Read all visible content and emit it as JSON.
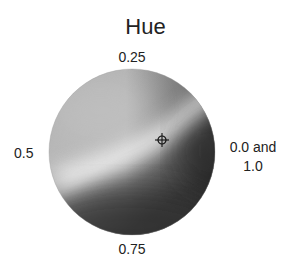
{
  "diagram": {
    "title": "Hue",
    "labels": {
      "top": "0.25",
      "left": "0.5",
      "bottom": "0.75",
      "right_line1": "0.0 and",
      "right_line2": "1.0"
    },
    "wheel": {
      "center_x": 132,
      "center_y": 152,
      "radius": 83,
      "rendering": "grayscale",
      "colors": {
        "light_region": "#b4b4b4",
        "highlight_band": "#e6e6e6",
        "mid_region": "#8c8c8c",
        "dark_region": "#3c3c3c",
        "darkest": "#2e2e2e"
      }
    },
    "marker": {
      "type": "crosshair",
      "x": 162,
      "y": 140
    }
  }
}
